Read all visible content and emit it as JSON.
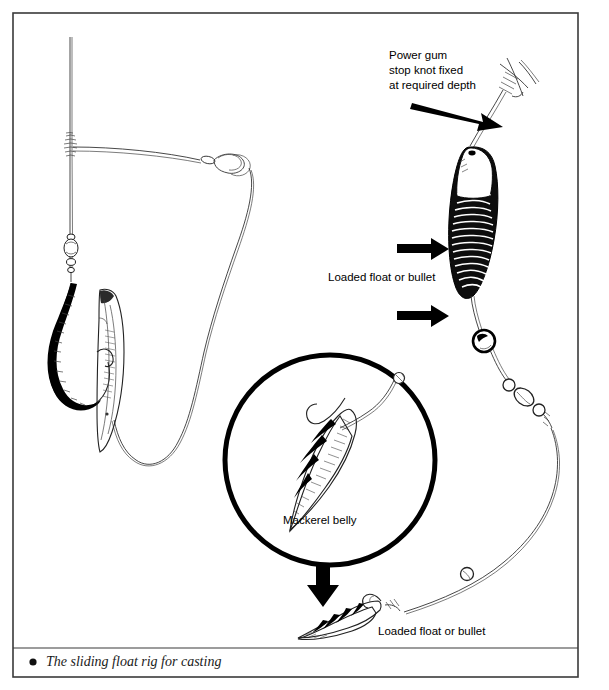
{
  "figure": {
    "title": "The sliding float rig for casting",
    "caption": {
      "bullet": "●",
      "text": "The sliding float rig for casting"
    },
    "border_color": "#3a3a3a",
    "ink_color": "#000000",
    "background_color": "#ffffff"
  },
  "labels": {
    "power_gum_line1": "Power gum",
    "power_gum_line2": "stop knot fixed",
    "power_gum_line3": "at required depth",
    "loaded_float_upper": "Loaded float or bullet",
    "loaded_float_lower": "Loaded float or bullet",
    "mackerel_belly": "Mackerel belly"
  },
  "annotations": {
    "arrow_to_stop_knot": "arrow-diagonal-down-right",
    "arrow_to_float": "arrow-right",
    "arrow_to_bead": "arrow-right",
    "arrow_inset_to_bait": "arrow-down"
  },
  "components": {
    "left_rig": [
      "main-line",
      "power-gum-stop-knot",
      "snap-link-swivel",
      "bead",
      "barrel-swivel",
      "hook",
      "mackerel-belly-bait"
    ],
    "right_rig": [
      "power-gum-stop-knot",
      "loaded-float-bullet",
      "round-bead",
      "barrel-swivel",
      "link-swivel",
      "hook-snood",
      "hook",
      "mackerel-belly-bait"
    ],
    "inset": [
      "detail-circle",
      "hook",
      "mackerel-belly-bait"
    ]
  }
}
